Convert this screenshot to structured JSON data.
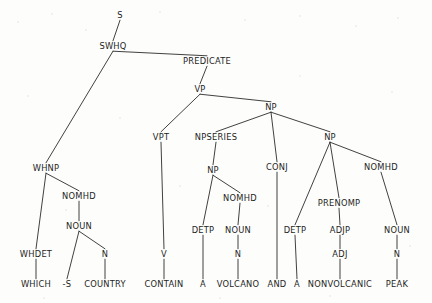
{
  "figure": {
    "name": "syntactic-parse-tree",
    "sentence": "WHICH -S COUNTRY CONTAIN A VOLCANO AND A NONVOLCANIC PEAK",
    "background_color": "#fdfdfc",
    "line_color": "#2b2b2b",
    "text_color": "#1d1d1d",
    "width": 432,
    "height": 303
  },
  "nodes": [
    {
      "id": "s",
      "label": "S",
      "x": 120,
      "y": 15,
      "kind": "nonterminal"
    },
    {
      "id": "swhq",
      "label": "SWHQ",
      "x": 113,
      "y": 46,
      "kind": "nonterminal"
    },
    {
      "id": "predicate",
      "label": "PREDICATE",
      "x": 207,
      "y": 61,
      "kind": "nonterminal"
    },
    {
      "id": "vp",
      "label": "VP",
      "x": 200,
      "y": 89,
      "kind": "nonterminal"
    },
    {
      "id": "np-top",
      "label": "NP",
      "x": 271,
      "y": 107,
      "kind": "nonterminal"
    },
    {
      "id": "vpt",
      "label": "VPT",
      "x": 161,
      "y": 137,
      "kind": "nonterminal"
    },
    {
      "id": "npseries",
      "label": "NPSERIES",
      "x": 216,
      "y": 137,
      "kind": "nonterminal"
    },
    {
      "id": "np-right",
      "label": "NP",
      "x": 330,
      "y": 137,
      "kind": "nonterminal"
    },
    {
      "id": "whnp",
      "label": "WHNP",
      "x": 46,
      "y": 168,
      "kind": "nonterminal"
    },
    {
      "id": "np-mid",
      "label": "NP",
      "x": 213,
      "y": 170,
      "kind": "nonterminal"
    },
    {
      "id": "conj",
      "label": "CONJ",
      "x": 277,
      "y": 167,
      "kind": "nonterminal"
    },
    {
      "id": "nomhd-right",
      "label": "NOMHD",
      "x": 381,
      "y": 167,
      "kind": "nonterminal"
    },
    {
      "id": "nomhd-wh",
      "label": "NOMHD",
      "x": 79,
      "y": 196,
      "kind": "nonterminal"
    },
    {
      "id": "nomhd-mid",
      "label": "NOMHD",
      "x": 240,
      "y": 198,
      "kind": "nonterminal"
    },
    {
      "id": "prenomp",
      "label": "PRENOMP",
      "x": 339,
      "y": 203,
      "kind": "nonterminal"
    },
    {
      "id": "noun-wh",
      "label": "NOUN",
      "x": 79,
      "y": 226,
      "kind": "nonterminal"
    },
    {
      "id": "detp-mid",
      "label": "DETP",
      "x": 203,
      "y": 230,
      "kind": "nonterminal"
    },
    {
      "id": "noun-mid",
      "label": "NOUN",
      "x": 238,
      "y": 230,
      "kind": "nonterminal"
    },
    {
      "id": "detp-right",
      "label": "DETP",
      "x": 295,
      "y": 230,
      "kind": "nonterminal"
    },
    {
      "id": "adjp",
      "label": "ADJP",
      "x": 340,
      "y": 230,
      "kind": "nonterminal"
    },
    {
      "id": "noun-right",
      "label": "NOUN",
      "x": 397,
      "y": 230,
      "kind": "nonterminal"
    },
    {
      "id": "whdet",
      "label": "WHDET",
      "x": 36,
      "y": 254,
      "kind": "nonterminal"
    },
    {
      "id": "n-wh",
      "label": "N",
      "x": 105,
      "y": 254,
      "kind": "nonterminal"
    },
    {
      "id": "v",
      "label": "V",
      "x": 164,
      "y": 254,
      "kind": "nonterminal"
    },
    {
      "id": "n-mid",
      "label": "N",
      "x": 238,
      "y": 254,
      "kind": "nonterminal"
    },
    {
      "id": "adj",
      "label": "ADJ",
      "x": 340,
      "y": 254,
      "kind": "nonterminal"
    },
    {
      "id": "n-right",
      "label": "N",
      "x": 397,
      "y": 254,
      "kind": "nonterminal"
    },
    {
      "id": "t-which",
      "label": "WHICH",
      "x": 36,
      "y": 284,
      "kind": "terminal"
    },
    {
      "id": "t-s",
      "label": "-S",
      "x": 67,
      "y": 284,
      "kind": "terminal"
    },
    {
      "id": "t-country",
      "label": "COUNTRY",
      "x": 105,
      "y": 284,
      "kind": "terminal"
    },
    {
      "id": "t-contain",
      "label": "CONTAIN",
      "x": 164,
      "y": 284,
      "kind": "terminal"
    },
    {
      "id": "t-a1",
      "label": "A",
      "x": 203,
      "y": 284,
      "kind": "terminal"
    },
    {
      "id": "t-volcano",
      "label": "VOLCANO",
      "x": 238,
      "y": 284,
      "kind": "terminal"
    },
    {
      "id": "t-and",
      "label": "AND",
      "x": 277,
      "y": 284,
      "kind": "terminal"
    },
    {
      "id": "t-a2",
      "label": "A",
      "x": 297,
      "y": 284,
      "kind": "terminal"
    },
    {
      "id": "t-nonvolcanic",
      "label": "NONVOLCANIC",
      "x": 340,
      "y": 284,
      "kind": "terminal"
    },
    {
      "id": "t-peak",
      "label": "PEAK",
      "x": 397,
      "y": 284,
      "kind": "terminal"
    }
  ],
  "edges": [
    {
      "from": "s",
      "to": "swhq"
    },
    {
      "from": "swhq",
      "to": "whnp"
    },
    {
      "from": "swhq",
      "to": "predicate"
    },
    {
      "from": "predicate",
      "to": "vp"
    },
    {
      "from": "vp",
      "to": "vpt"
    },
    {
      "from": "vp",
      "to": "np-top"
    },
    {
      "from": "np-top",
      "to": "npseries"
    },
    {
      "from": "np-top",
      "to": "conj"
    },
    {
      "from": "np-top",
      "to": "np-right"
    },
    {
      "from": "npseries",
      "to": "np-mid"
    },
    {
      "from": "whnp",
      "to": "whdet"
    },
    {
      "from": "whnp",
      "to": "nomhd-wh"
    },
    {
      "from": "nomhd-wh",
      "to": "noun-wh"
    },
    {
      "from": "noun-wh",
      "to": "t-s"
    },
    {
      "from": "noun-wh",
      "to": "n-wh"
    },
    {
      "from": "n-wh",
      "to": "t-country"
    },
    {
      "from": "whdet",
      "to": "t-which"
    },
    {
      "from": "vpt",
      "to": "v"
    },
    {
      "from": "v",
      "to": "t-contain"
    },
    {
      "from": "np-mid",
      "to": "detp-mid"
    },
    {
      "from": "np-mid",
      "to": "nomhd-mid"
    },
    {
      "from": "nomhd-mid",
      "to": "noun-mid"
    },
    {
      "from": "noun-mid",
      "to": "n-mid"
    },
    {
      "from": "n-mid",
      "to": "t-volcano"
    },
    {
      "from": "detp-mid",
      "to": "t-a1"
    },
    {
      "from": "conj",
      "to": "t-and"
    },
    {
      "from": "np-right",
      "to": "detp-right"
    },
    {
      "from": "np-right",
      "to": "prenomp"
    },
    {
      "from": "np-right",
      "to": "nomhd-right"
    },
    {
      "from": "nomhd-right",
      "to": "noun-right"
    },
    {
      "from": "prenomp",
      "to": "adjp"
    },
    {
      "from": "adjp",
      "to": "adj"
    },
    {
      "from": "adj",
      "to": "t-nonvolcanic"
    },
    {
      "from": "noun-right",
      "to": "n-right"
    },
    {
      "from": "n-right",
      "to": "t-peak"
    },
    {
      "from": "detp-right",
      "to": "t-a2"
    }
  ],
  "speckles": [
    {
      "x": 18,
      "y": 22,
      "r": 1.4
    },
    {
      "x": 52,
      "y": 14,
      "r": 1.1
    },
    {
      "x": 86,
      "y": 30,
      "r": 1.0
    },
    {
      "x": 160,
      "y": 12,
      "r": 1.3
    },
    {
      "x": 245,
      "y": 20,
      "r": 1.0
    },
    {
      "x": 300,
      "y": 16,
      "r": 1.2
    },
    {
      "x": 356,
      "y": 26,
      "r": 1.1
    },
    {
      "x": 398,
      "y": 18,
      "r": 1.0
    },
    {
      "x": 28,
      "y": 96,
      "r": 1.2
    },
    {
      "x": 120,
      "y": 118,
      "r": 1.0
    },
    {
      "x": 300,
      "y": 76,
      "r": 1.1
    },
    {
      "x": 392,
      "y": 92,
      "r": 1.0
    },
    {
      "x": 66,
      "y": 210,
      "r": 1.0
    },
    {
      "x": 180,
      "y": 186,
      "r": 1.1
    },
    {
      "x": 268,
      "y": 206,
      "r": 1.0
    },
    {
      "x": 410,
      "y": 246,
      "r": 1.2
    },
    {
      "x": 44,
      "y": 298,
      "r": 1.0
    },
    {
      "x": 220,
      "y": 298,
      "r": 1.1
    },
    {
      "x": 330,
      "y": 296,
      "r": 1.0
    }
  ]
}
